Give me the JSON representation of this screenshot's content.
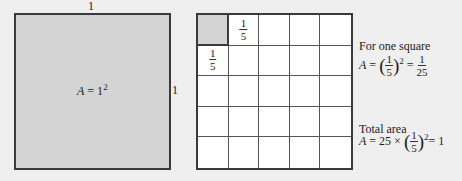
{
  "left_figure": {
    "top_side_label": "1",
    "right_side_label": "1",
    "area_label_var": "A",
    "area_label_eq": " = 1",
    "area_label_exp": "2",
    "fill_color": "#d4d4d4"
  },
  "grid_figure": {
    "rows": 5,
    "cols": 5,
    "shaded_cell": [
      0,
      0
    ],
    "top_cell_fraction": {
      "num": "1",
      "den": "5"
    },
    "left_cell_fraction": {
      "num": "1",
      "den": "5"
    }
  },
  "annotations": {
    "one_square_title": "For one square",
    "one_square_var": "A",
    "one_square_eq": " = ",
    "one_square_frac": {
      "num": "1",
      "den": "5"
    },
    "one_square_exp": "2",
    "one_square_eq2": " = ",
    "one_square_result": {
      "num": "1",
      "den": "25"
    },
    "total_title": "Total area",
    "total_var": "A",
    "total_eq": " = 25 × ",
    "total_frac": {
      "num": "1",
      "den": "5"
    },
    "total_exp": "2",
    "total_result": "= 1"
  }
}
